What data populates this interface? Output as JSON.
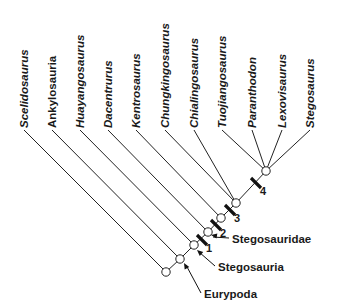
{
  "diagram": {
    "type": "cladogram",
    "taxa": [
      {
        "name": "Scelidosaurus",
        "italic": true,
        "x": 24
      },
      {
        "name": "Ankylosauria",
        "italic": false,
        "x": 52
      },
      {
        "name": "Huayangosaurus",
        "italic": true,
        "x": 80
      },
      {
        "name": "Dacentrurus",
        "italic": true,
        "x": 108
      },
      {
        "name": "Kentrosaurus",
        "italic": true,
        "x": 136
      },
      {
        "name": "Chungkingosaurus",
        "italic": true,
        "x": 165
      },
      {
        "name": "Chialingosaurus",
        "italic": true,
        "x": 194
      },
      {
        "name": "Tuojiangosaurus",
        "italic": true,
        "x": 222
      },
      {
        "name": "Paranthodon",
        "italic": true,
        "x": 252
      },
      {
        "name": "Lexovisaurus",
        "italic": true,
        "x": 282
      },
      {
        "name": "Stegosaurus",
        "italic": true,
        "x": 310
      }
    ],
    "clade_labels": [
      {
        "name": "Stegosauridae",
        "text_x": 232,
        "text_y": 243,
        "arrow_to": [
          211,
          235
        ]
      },
      {
        "name": "Stegosauria",
        "text_x": 218,
        "text_y": 271,
        "arrow_to": [
          197,
          250
        ]
      },
      {
        "name": "Eurypoda",
        "text_x": 204,
        "text_y": 298,
        "arrow_to": [
          184,
          263
        ]
      }
    ],
    "synapomorphy_marks": [
      {
        "label": "1",
        "x": 202,
        "y": 240
      },
      {
        "label": "2",
        "x": 216,
        "y": 225
      },
      {
        "label": "3",
        "x": 230,
        "y": 210
      },
      {
        "label": "4",
        "x": 256,
        "y": 183
      }
    ]
  }
}
